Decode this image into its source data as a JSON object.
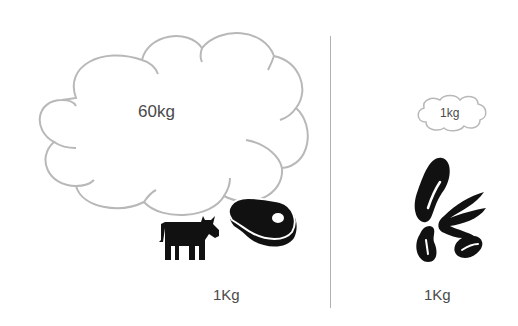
{
  "left_panel": {
    "cloud_label": "60kg",
    "weight_label": "1Kg",
    "icons": [
      "cow-icon",
      "steak-icon"
    ]
  },
  "right_panel": {
    "cloud_label": "1kg",
    "weight_label": "1Kg",
    "icons": [
      "beans-icon"
    ]
  },
  "colors": {
    "cloud_stroke": "#b8b8b8",
    "divider": "#b0b0b0",
    "icon_fill": "#111111",
    "text": "#4a4a4a"
  }
}
